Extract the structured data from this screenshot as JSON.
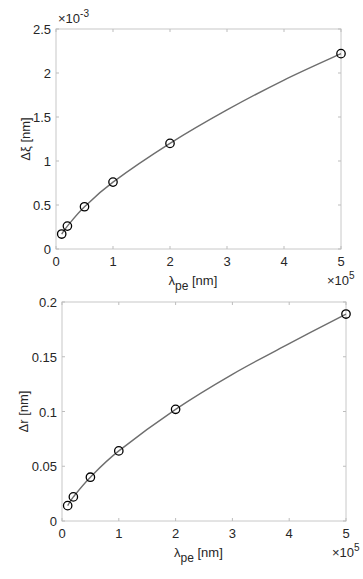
{
  "chart_data": [
    {
      "type": "line",
      "title": "",
      "xlabel": "λ_pe [nm]",
      "ylabel": "Δξ [nm]",
      "x_multiplier": "×10^5",
      "y_multiplier": "×10^-3",
      "xlim": [
        0,
        5
      ],
      "ylim": [
        0,
        2.5
      ],
      "xticks": [
        "0",
        "1",
        "2",
        "3",
        "4",
        "5"
      ],
      "yticks": [
        "0",
        "0.5",
        "1",
        "1.5",
        "2",
        "2.5"
      ],
      "grid": false,
      "series": [
        {
          "name": "fit",
          "style": "line",
          "color": "#6e6e6e",
          "x": [
            0.1,
            0.2,
            0.5,
            1,
            2,
            3,
            4,
            5
          ],
          "values": [
            0.17,
            0.26,
            0.48,
            0.76,
            1.2,
            1.58,
            1.92,
            2.22
          ]
        },
        {
          "name": "data",
          "style": "markers",
          "marker": "circle",
          "color": "#000000",
          "x": [
            0.1,
            0.2,
            0.5,
            1,
            2,
            5
          ],
          "values": [
            0.17,
            0.26,
            0.48,
            0.76,
            1.2,
            2.22
          ]
        }
      ]
    },
    {
      "type": "line",
      "title": "",
      "xlabel": "λ_pe [nm]",
      "ylabel": "Δr [nm]",
      "x_multiplier": "×10^5",
      "xlim": [
        0,
        5
      ],
      "ylim": [
        0,
        0.2
      ],
      "xticks": [
        "0",
        "1",
        "2",
        "3",
        "4",
        "5"
      ],
      "yticks": [
        "0",
        "0.05",
        "0.1",
        "0.15",
        "0.2"
      ],
      "grid": false,
      "series": [
        {
          "name": "fit",
          "style": "line",
          "color": "#6e6e6e",
          "x": [
            0.1,
            0.2,
            0.5,
            1,
            2,
            3,
            4,
            5
          ],
          "values": [
            0.014,
            0.022,
            0.04,
            0.064,
            0.102,
            0.134,
            0.162,
            0.189
          ]
        },
        {
          "name": "data",
          "style": "markers",
          "marker": "circle",
          "color": "#000000",
          "x": [
            0.1,
            0.2,
            0.5,
            1,
            2,
            5
          ],
          "values": [
            0.014,
            0.022,
            0.04,
            0.064,
            0.102,
            0.189
          ]
        }
      ]
    }
  ]
}
